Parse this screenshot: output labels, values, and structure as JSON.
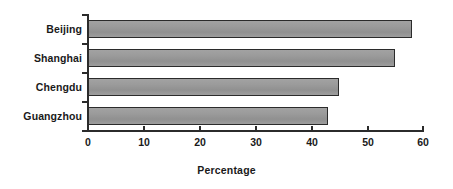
{
  "chart_data": {
    "type": "bar",
    "orientation": "horizontal",
    "title": "",
    "xlabel": "Percentage",
    "ylabel": "",
    "categories": [
      "Beijing",
      "Shanghai",
      "Chengdu",
      "Guangzhou"
    ],
    "values": [
      58,
      55,
      45,
      43
    ],
    "series": [
      {
        "name": "Percentage",
        "values": [
          58,
          55,
          45,
          43
        ]
      }
    ],
    "xlim": [
      0,
      60
    ],
    "xticks": [
      0,
      10,
      20,
      30,
      40,
      50,
      60
    ],
    "xtick_labels": [
      "0",
      "10",
      "20",
      "30",
      "40",
      "50",
      "60"
    ],
    "grid": false,
    "legend": false,
    "legend_position": "none",
    "bar_fill_color": "#9b9b9b",
    "bar_border_color": "#2b2b2b",
    "axis_color": "#2b2b2b",
    "background_color": "#ffffff",
    "text_color": "#1a1a1a"
  }
}
